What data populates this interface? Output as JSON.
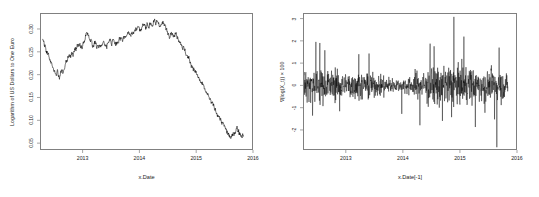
{
  "figure": {
    "background": "#ffffff",
    "line_color": "#000000",
    "axis_color": "#808080",
    "text_color": "#1a1a1a"
  },
  "chart_data": [
    {
      "type": "line",
      "panel": "left",
      "title": "",
      "xlabel": "x.Date",
      "ylabel": "Logarithm of US Dollars to One Euro",
      "xlim": [
        2012.25,
        2016.0
      ],
      "ylim": [
        0.035,
        0.335
      ],
      "grid": false,
      "legend": null,
      "xticks": [
        "2013",
        "2014",
        "2015",
        "2016"
      ],
      "xtick_values": [
        2013,
        2014,
        2015,
        2016
      ],
      "yticks": [
        "0.05",
        "0.10",
        "0.15",
        "0.20",
        "0.25",
        "0.30"
      ],
      "ytick_values": [
        0.05,
        0.1,
        0.15,
        0.2,
        0.25,
        0.3
      ],
      "x": [
        2012.28,
        2012.31,
        2012.34,
        2012.36,
        2012.38,
        2012.41,
        2012.43,
        2012.46,
        2012.48,
        2012.5,
        2012.52,
        2012.54,
        2012.56,
        2012.58,
        2012.6,
        2012.62,
        2012.64,
        2012.66,
        2012.68,
        2012.7,
        2012.72,
        2012.74,
        2012.76,
        2012.78,
        2012.8,
        2012.82,
        2012.84,
        2012.86,
        2012.88,
        2012.9,
        2012.92,
        2012.94,
        2012.96,
        2012.98,
        2013.0,
        2013.03,
        2013.06,
        2013.09,
        2013.12,
        2013.15,
        2013.18,
        2013.21,
        2013.24,
        2013.27,
        2013.3,
        2013.33,
        2013.36,
        2013.39,
        2013.42,
        2013.45,
        2013.48,
        2013.51,
        2013.54,
        2013.57,
        2013.6,
        2013.63,
        2013.66,
        2013.69,
        2013.72,
        2013.75,
        2013.78,
        2013.81,
        2013.84,
        2013.87,
        2013.9,
        2013.93,
        2013.96,
        2013.99,
        2014.02,
        2014.05,
        2014.08,
        2014.11,
        2014.14,
        2014.17,
        2014.2,
        2014.23,
        2014.26,
        2014.29,
        2014.32,
        2014.35,
        2014.38,
        2014.41,
        2014.44,
        2014.47,
        2014.5,
        2014.53,
        2014.56,
        2014.59,
        2014.62,
        2014.65,
        2014.68,
        2014.71,
        2014.74,
        2014.77,
        2014.8,
        2014.83,
        2014.86,
        2014.89,
        2014.92,
        2014.95,
        2014.98,
        2015.01,
        2015.04,
        2015.07,
        2015.1,
        2015.13,
        2015.16,
        2015.19,
        2015.22,
        2015.25,
        2015.28,
        2015.31,
        2015.34,
        2015.37,
        2015.4,
        2015.43,
        2015.46,
        2015.49,
        2015.52,
        2015.55,
        2015.58,
        2015.61,
        2015.64,
        2015.67,
        2015.7,
        2015.73,
        2015.76,
        2015.79,
        2015.82,
        2015.85
      ],
      "y": [
        0.279,
        0.268,
        0.257,
        0.248,
        0.24,
        0.232,
        0.226,
        0.218,
        0.211,
        0.204,
        0.201,
        0.207,
        0.199,
        0.196,
        0.203,
        0.211,
        0.207,
        0.215,
        0.222,
        0.229,
        0.235,
        0.241,
        0.237,
        0.244,
        0.251,
        0.247,
        0.254,
        0.261,
        0.257,
        0.264,
        0.271,
        0.266,
        0.258,
        0.265,
        0.273,
        0.281,
        0.292,
        0.285,
        0.278,
        0.271,
        0.265,
        0.272,
        0.259,
        0.266,
        0.258,
        0.266,
        0.274,
        0.268,
        0.261,
        0.269,
        0.277,
        0.271,
        0.281,
        0.274,
        0.268,
        0.276,
        0.284,
        0.278,
        0.287,
        0.281,
        0.289,
        0.296,
        0.29,
        0.298,
        0.292,
        0.3,
        0.308,
        0.301,
        0.296,
        0.304,
        0.312,
        0.306,
        0.314,
        0.308,
        0.316,
        0.31,
        0.318,
        0.312,
        0.32,
        0.314,
        0.308,
        0.316,
        0.31,
        0.303,
        0.296,
        0.289,
        0.297,
        0.291,
        0.284,
        0.292,
        0.285,
        0.277,
        0.27,
        0.262,
        0.254,
        0.247,
        0.239,
        0.232,
        0.224,
        0.217,
        0.21,
        0.202,
        0.195,
        0.188,
        0.181,
        0.174,
        0.167,
        0.16,
        0.152,
        0.145,
        0.138,
        0.131,
        0.124,
        0.117,
        0.11,
        0.103,
        0.096,
        0.089,
        0.082,
        0.075,
        0.068,
        0.061,
        0.06,
        0.068,
        0.075,
        0.082,
        0.076,
        0.069,
        0.063,
        0.071
      ],
      "description": "Log USD per Euro falls from about 0.33 in late 2013 to around 0.08 by mid-2015, with a sharp decline through 2014."
    },
    {
      "type": "line",
      "panel": "right",
      "title": "",
      "xlabel": "x.Date[-1]",
      "ylabel": "∇(log(X_t)) × 100",
      "xlim": [
        2012.25,
        2016.0
      ],
      "ylim": [
        -2.9,
        3.25
      ],
      "grid": false,
      "legend": null,
      "xticks": [
        "2013",
        "2014",
        "2015",
        "2016"
      ],
      "xtick_values": [
        2013,
        2014,
        2015,
        2016
      ],
      "yticks": [
        "3",
        "2",
        "1",
        "0",
        "-1",
        "-2"
      ],
      "ytick_values": [
        3,
        2,
        1,
        0,
        -1,
        -2
      ],
      "description": "First differences of the log exchange rate times 100 (daily percent returns). Mean near zero with volatility clustering: elevated variance in 2012 and mid-2014 through 2015, a quiet stretch in early 2014, extreme spikes to about +3.1 near late 2014 and about -2.8 in late 2015."
    }
  ]
}
